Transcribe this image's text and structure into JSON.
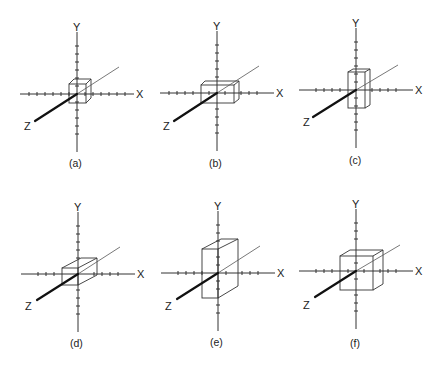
{
  "figure": {
    "axis_labels": {
      "x": "X",
      "y": "Y",
      "z": "Z"
    },
    "panels": [
      {
        "caption": "(a)",
        "box": "small cube at origin"
      },
      {
        "caption": "(b)",
        "box": "box stretched along X"
      },
      {
        "caption": "(c)",
        "box": "box stretched along Y"
      },
      {
        "caption": "(d)",
        "box": "box stretched along Z"
      },
      {
        "caption": "(e)",
        "box": "box stretched along Y and Z"
      },
      {
        "caption": "(f)",
        "box": "large cube, scaled uniformly"
      }
    ]
  }
}
